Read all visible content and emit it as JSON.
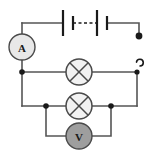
{
  "diagram": {
    "background_color": "#ffffff",
    "wire_color": "#555555",
    "symbol_outline_color": "#4a4a4a",
    "node_color": "#1a1a1a"
  },
  "components": {
    "ammeter": {
      "label": "A",
      "name": "ammeter",
      "fill_color": "#e8e8e8",
      "cx": 22,
      "cy": 47,
      "r": 13
    },
    "voltmeter": {
      "label": "V",
      "name": "voltmeter",
      "fill_color": "#9e9e9e",
      "cx": 79,
      "cy": 136,
      "r": 13
    },
    "battery": {
      "name": "battery-two-cells",
      "cell_count": 2,
      "long_plates": [
        {
          "x": 63,
          "y1": 10,
          "y2": 36
        },
        {
          "x": 97,
          "y1": 10,
          "y2": 36
        }
      ],
      "short_plates": [
        {
          "x": 73,
          "y1": 16,
          "y2": 30
        },
        {
          "x": 107,
          "y1": 16,
          "y2": 30
        }
      ],
      "dashed_link": {
        "x1": 73,
        "x2": 97,
        "y": 23
      }
    },
    "lamp_top": {
      "name": "lamp-top",
      "cx": 79,
      "cy": 72,
      "r": 13
    },
    "lamp_bottom": {
      "name": "lamp-bottom",
      "cx": 79,
      "cy": 106,
      "r": 13
    },
    "switch": {
      "name": "open-switch",
      "state": "open",
      "contact_lower": {
        "cx": 137,
        "cy": 72
      },
      "contact_upper": {
        "cx": 137,
        "cy": 63
      }
    },
    "terminal": {
      "name": "battery-terminal",
      "cx": 139,
      "cy": 36,
      "r": 3.2
    }
  },
  "nodes": [
    {
      "name": "node-ammeter-branch",
      "cx": 22,
      "cy": 72
    },
    {
      "name": "node-voltmeter-left",
      "cx": 46,
      "cy": 106
    },
    {
      "name": "node-voltmeter-right",
      "cx": 111,
      "cy": 106
    }
  ],
  "wires": [
    {
      "name": "wire-top-left-to-battery",
      "d": "M 22 23 L 63 23"
    },
    {
      "name": "wire-battery-to-terminal",
      "d": "M 107 23 L 139 23 L 139 36"
    },
    {
      "name": "wire-left-vertical-upper",
      "d": "M 22 23 L 22 34"
    },
    {
      "name": "wire-ammeter-to-node",
      "d": "M 22 60 L 22 72"
    },
    {
      "name": "wire-left-vertical-lower",
      "d": "M 22 72 L 22 106"
    },
    {
      "name": "wire-mid-left-to-lamp",
      "d": "M 22 72 L 66 72"
    },
    {
      "name": "wire-mid-lamp-to-switch",
      "d": "M 92 72 L 137 72"
    },
    {
      "name": "wire-right-vertical",
      "d": "M 137 72 L 137 106"
    },
    {
      "name": "wire-bottom-left-to-lamp",
      "d": "M 22 106 L 66 106"
    },
    {
      "name": "wire-bottom-lamp-to-right",
      "d": "M 92 106 L 137 106"
    },
    {
      "name": "wire-voltmeter-left-drop",
      "d": "M 46 106 L 46 136 L 66 136"
    },
    {
      "name": "wire-voltmeter-right-drop",
      "d": "M 111 106 L 111 136 L 92 136"
    }
  ]
}
